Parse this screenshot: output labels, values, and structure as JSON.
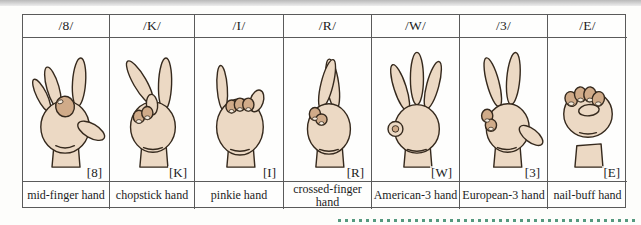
{
  "table": {
    "columns": [
      {
        "phoneme": "/8/",
        "bracket": "[8]",
        "name": "mid-finger hand",
        "icon": "hand-8-icon"
      },
      {
        "phoneme": "/K/",
        "bracket": "[K]",
        "name": "chopstick hand",
        "icon": "hand-k-icon"
      },
      {
        "phoneme": "/I/",
        "bracket": "[I]",
        "name": "pinkie hand",
        "icon": "hand-i-icon"
      },
      {
        "phoneme": "/R/",
        "bracket": "[R]",
        "name": "crossed-finger hand",
        "icon": "hand-r-icon"
      },
      {
        "phoneme": "/W/",
        "bracket": "[W]",
        "name": "American-3 hand",
        "icon": "hand-w-icon"
      },
      {
        "phoneme": "/3/",
        "bracket": "[3]",
        "name": "European-3 hand",
        "icon": "hand-3-icon"
      },
      {
        "phoneme": "/E/",
        "bracket": "[E]",
        "name": "nail-buff hand",
        "icon": "hand-e-icon"
      }
    ]
  },
  "colors": {
    "skin": "#ecd9c4",
    "skin_shade": "#d0ab89",
    "outline": "#35291d",
    "table_border": "#5a5a5a",
    "dashed_line": "#55997f",
    "top_strip": "#b9b9b9"
  }
}
